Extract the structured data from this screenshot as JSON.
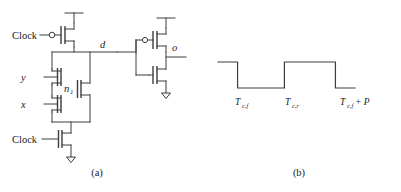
{
  "figure": {
    "panel_a": {
      "caption": "(a)",
      "description": "dynamic-logic-gate-schematic",
      "labels": {
        "clock_top": "Clock",
        "clock_bottom": "Clock",
        "input_y": "y",
        "input_x": "x",
        "node_n1_base": "n",
        "node_n1_sub": "1",
        "node_d": "d",
        "output_o": "o"
      },
      "icons": {
        "pmos_precharge": "pmos-transistor-icon",
        "nmos_y": "nmos-transistor-icon",
        "nmos_x": "nmos-transistor-icon",
        "nmos_mid": "nmos-transistor-icon",
        "nmos_eval": "nmos-transistor-icon",
        "inv_pmos": "pmos-transistor-icon",
        "inv_nmos": "nmos-transistor-icon",
        "ground_eval": "ground-icon",
        "ground_inv": "ground-icon",
        "vdd_precharge": "vdd-rail-icon",
        "vdd_inv": "vdd-rail-icon",
        "bubble_precharge": "inversion-bubble-icon",
        "bubble_inv": "inversion-bubble-icon"
      }
    },
    "panel_b": {
      "caption": "(b)",
      "description": "clock-timing-waveform",
      "axis_labels": [
        {
          "base": "T",
          "sub": "c,f",
          "suffix": ""
        },
        {
          "base": "T",
          "sub": "c,r",
          "suffix": ""
        },
        {
          "base": "T",
          "sub": "c,f",
          "suffix": " + P"
        }
      ]
    }
  },
  "chart_data": {
    "type": "line",
    "title": "",
    "xlabel": "",
    "ylabel": "",
    "x": [
      0,
      28,
      28,
      95,
      95,
      168,
      168,
      196
    ],
    "y": [
      1,
      1,
      0,
      0,
      1,
      1,
      0,
      0
    ],
    "tick_positions": [
      28,
      95,
      168
    ],
    "tick_labels": [
      "T_c,f",
      "T_c,r",
      "T_c,f + P"
    ],
    "ylim": [
      0,
      1
    ],
    "grid": false,
    "legend": false
  },
  "colors": {
    "ink": "#3d3d3d",
    "text": "#1a1a1a",
    "background": "#ffffff"
  }
}
